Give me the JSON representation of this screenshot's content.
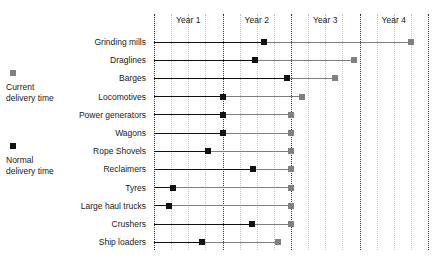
{
  "legend": {
    "current": {
      "label_line1": "Current",
      "label_line2": "delivery time",
      "color": "#808080",
      "swatch_name": "gray-square"
    },
    "normal": {
      "label_line1": "Normal",
      "label_line2": "delivery time",
      "color": "#111111",
      "swatch_name": "black-square"
    }
  },
  "chart_data": {
    "type": "bar",
    "title": "",
    "xlabel": "",
    "ylabel": "",
    "orientation": "horizontal",
    "xlim": [
      0,
      4
    ],
    "x_unit": "years",
    "grid": true,
    "grid_major_interval": 1,
    "grid_minor_interval": 0.25,
    "axis_tick_labels": [
      "Year 1",
      "Year 2",
      "Year 3",
      "Year 4"
    ],
    "axis_tick_label_positions": [
      0.5,
      1.5,
      2.5,
      3.5
    ],
    "legend_position": "left",
    "categories": [
      "Grinding mills",
      "Draglines",
      "Barges",
      "Locomotives",
      "Power generators",
      "Wagons",
      "Rope Shovels",
      "Reclaimers",
      "Tyres",
      "Large haul trucks",
      "Crushers",
      "Ship loaders"
    ],
    "series": [
      {
        "name": "Normal delivery time",
        "color": "#111111",
        "values": [
          1.6,
          1.47,
          1.94,
          1.0,
          1.0,
          1.0,
          0.79,
          1.45,
          0.28,
          0.22,
          1.43,
          0.7
        ]
      },
      {
        "name": "Current delivery time",
        "color": "#808080",
        "values": [
          3.75,
          2.92,
          2.64,
          2.16,
          2.0,
          2.0,
          2.0,
          2.0,
          2.0,
          2.0,
          2.0,
          1.81
        ]
      }
    ]
  }
}
